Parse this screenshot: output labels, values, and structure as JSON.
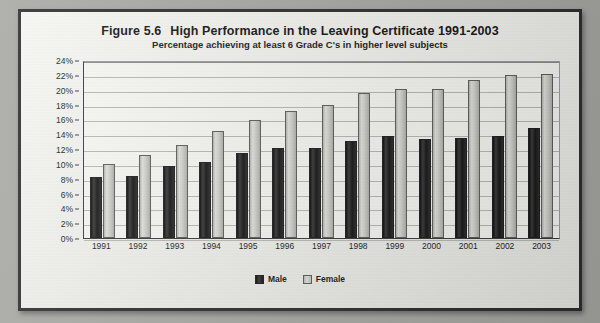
{
  "figure": {
    "label": "Figure 5.6",
    "title": "High Performance in the Leaving Certificate 1991-2003",
    "subtitle": "Percentage achieving at least 6 Grade C's in higher level subjects"
  },
  "legend": {
    "male_label": "Male",
    "female_label": "Female"
  },
  "colors": {
    "male": "#161616",
    "female": "#cfcfca",
    "frame_border": "#2e2e2e",
    "plot_background": "#f8f8f5",
    "gridline": "#b9b9b5"
  },
  "chart_data": {
    "type": "bar",
    "title": "High Performance in the Leaving Certificate 1991-2003",
    "subtitle": "Percentage achieving at least 6 Grade C's in higher level subjects",
    "xlabel": "",
    "ylabel": "",
    "ylim": [
      0,
      24
    ],
    "ytick_step": 2,
    "grid": true,
    "legend_position": "bottom",
    "categories": [
      "1991",
      "1992",
      "1993",
      "1994",
      "1995",
      "1996",
      "1997",
      "1998",
      "1999",
      "2000",
      "2001",
      "2002",
      "2003"
    ],
    "ytick_labels": [
      "24%",
      "22%",
      "20%",
      "18%",
      "16%",
      "14%",
      "12%",
      "10%",
      "8%",
      "6%",
      "4%",
      "2%",
      "0%"
    ],
    "series": [
      {
        "name": "Male",
        "values": [
          8.2,
          8.4,
          9.7,
          10.3,
          11.4,
          12.2,
          12.1,
          13.1,
          13.8,
          13.4,
          13.5,
          13.8,
          14.8
        ]
      },
      {
        "name": "Female",
        "values": [
          10.0,
          11.2,
          12.5,
          14.4,
          15.9,
          17.1,
          18.0,
          19.5,
          20.1,
          20.1,
          21.3,
          22.0,
          22.1
        ]
      }
    ]
  }
}
